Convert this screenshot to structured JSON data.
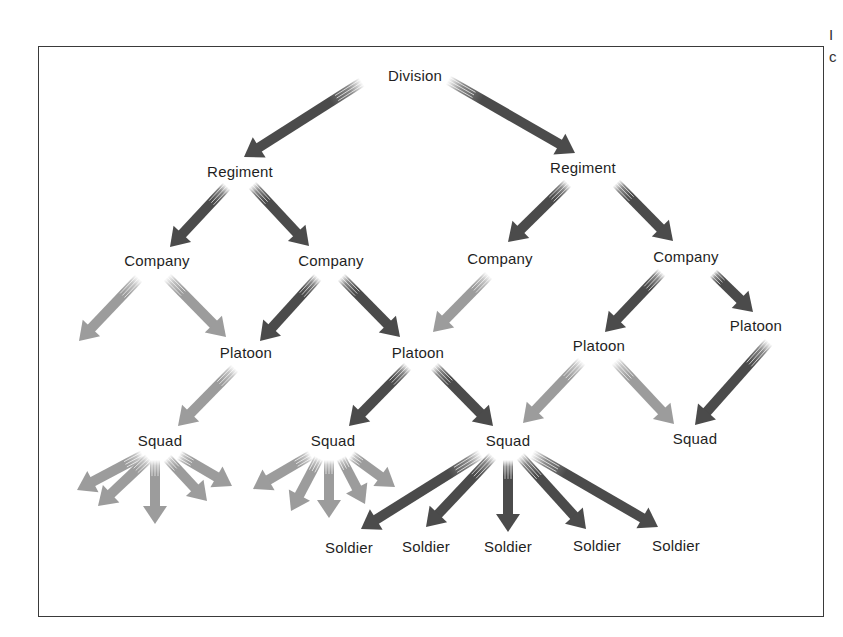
{
  "diagram": {
    "type": "hierarchy",
    "colors": {
      "dark_arrow": "#4b4b4b",
      "light_arrow": "#9c9c9c",
      "text": "#1f1f1f",
      "frame": "#3a3a3a",
      "background": "#ffffff"
    },
    "edge_text_fragments": [
      {
        "text": "I",
        "y": 36
      },
      {
        "text": "c",
        "y": 58
      }
    ],
    "nodes": [
      {
        "id": "division",
        "label": "Division",
        "x": 415,
        "y": 75
      },
      {
        "id": "regiment-1",
        "label": "Regiment",
        "x": 240,
        "y": 171
      },
      {
        "id": "regiment-2",
        "label": "Regiment",
        "x": 583,
        "y": 167
      },
      {
        "id": "company-1",
        "label": "Company",
        "x": 157,
        "y": 260
      },
      {
        "id": "company-2",
        "label": "Company",
        "x": 331,
        "y": 260
      },
      {
        "id": "company-3",
        "label": "Company",
        "x": 500,
        "y": 258
      },
      {
        "id": "company-4",
        "label": "Company",
        "x": 686,
        "y": 256
      },
      {
        "id": "platoon-1",
        "label": "Platoon",
        "x": 246,
        "y": 352
      },
      {
        "id": "platoon-2",
        "label": "Platoon",
        "x": 418,
        "y": 352
      },
      {
        "id": "platoon-3",
        "label": "Platoon",
        "x": 599,
        "y": 345
      },
      {
        "id": "platoon-4",
        "label": "Platoon",
        "x": 756,
        "y": 325
      },
      {
        "id": "squad-1",
        "label": "Squad",
        "x": 160,
        "y": 440
      },
      {
        "id": "squad-2",
        "label": "Squad",
        "x": 333,
        "y": 440
      },
      {
        "id": "squad-3",
        "label": "Squad",
        "x": 508,
        "y": 440
      },
      {
        "id": "squad-4",
        "label": "Squad",
        "x": 695,
        "y": 438
      },
      {
        "id": "soldier-1",
        "label": "Soldier",
        "x": 349,
        "y": 547
      },
      {
        "id": "soldier-2",
        "label": "Soldier",
        "x": 426,
        "y": 546
      },
      {
        "id": "soldier-3",
        "label": "Soldier",
        "x": 508,
        "y": 546
      },
      {
        "id": "soldier-4",
        "label": "Soldier",
        "x": 597,
        "y": 545
      },
      {
        "id": "soldier-5",
        "label": "Soldier",
        "x": 676,
        "y": 545
      }
    ],
    "arrows": [
      {
        "from": "division",
        "to": "regiment-1",
        "tone": "dark",
        "x1": 362,
        "y1": 82,
        "x2": 244,
        "y2": 157
      },
      {
        "from": "division",
        "to": "regiment-2",
        "tone": "dark",
        "x1": 448,
        "y1": 80,
        "x2": 575,
        "y2": 153
      },
      {
        "from": "regiment-1",
        "to": "company-1",
        "tone": "dark",
        "x1": 227,
        "y1": 186,
        "x2": 170,
        "y2": 247
      },
      {
        "from": "regiment-1",
        "to": "company-2",
        "tone": "dark",
        "x1": 252,
        "y1": 185,
        "x2": 309,
        "y2": 246
      },
      {
        "from": "regiment-2",
        "to": "company-3",
        "tone": "dark",
        "x1": 568,
        "y1": 183,
        "x2": 508,
        "y2": 242
      },
      {
        "from": "regiment-2",
        "to": "company-4",
        "tone": "dark",
        "x1": 616,
        "y1": 183,
        "x2": 673,
        "y2": 241
      },
      {
        "from": "company-1",
        "to": "platoon-offframe",
        "tone": "light",
        "x1": 139,
        "y1": 278,
        "x2": 79,
        "y2": 341
      },
      {
        "from": "company-1",
        "to": "platoon-1",
        "tone": "light",
        "x1": 167,
        "y1": 277,
        "x2": 226,
        "y2": 337
      },
      {
        "from": "company-2",
        "to": "platoon-1",
        "tone": "dark",
        "x1": 318,
        "y1": 277,
        "x2": 260,
        "y2": 341
      },
      {
        "from": "company-2",
        "to": "platoon-2",
        "tone": "dark",
        "x1": 341,
        "y1": 277,
        "x2": 400,
        "y2": 337
      },
      {
        "from": "company-3",
        "to": "platoon-2",
        "tone": "light",
        "x1": 489,
        "y1": 275,
        "x2": 433,
        "y2": 332
      },
      {
        "from": "company-4",
        "to": "platoon-3",
        "tone": "dark",
        "x1": 662,
        "y1": 272,
        "x2": 605,
        "y2": 332
      },
      {
        "from": "company-4",
        "to": "platoon-4",
        "tone": "dark",
        "x1": 713,
        "y1": 273,
        "x2": 753,
        "y2": 312
      },
      {
        "from": "platoon-1",
        "to": "squad-1",
        "tone": "light",
        "x1": 235,
        "y1": 368,
        "x2": 178,
        "y2": 426
      },
      {
        "from": "platoon-2",
        "to": "squad-2",
        "tone": "dark",
        "x1": 408,
        "y1": 366,
        "x2": 349,
        "y2": 426
      },
      {
        "from": "platoon-2",
        "to": "squad-3",
        "tone": "dark",
        "x1": 434,
        "y1": 366,
        "x2": 493,
        "y2": 426
      },
      {
        "from": "platoon-3",
        "to": "squad-3",
        "tone": "light",
        "x1": 582,
        "y1": 361,
        "x2": 523,
        "y2": 423
      },
      {
        "from": "platoon-3",
        "to": "squad-4",
        "tone": "light",
        "x1": 615,
        "y1": 361,
        "x2": 674,
        "y2": 424
      },
      {
        "from": "platoon-4",
        "to": "squad-4",
        "tone": "dark",
        "x1": 769,
        "y1": 342,
        "x2": 695,
        "y2": 425
      },
      {
        "from": "squad-1",
        "to": "soldier-offframe",
        "tone": "light",
        "x1": 143,
        "y1": 455,
        "x2": 77,
        "y2": 490
      },
      {
        "from": "squad-1",
        "to": "soldier-offframe",
        "tone": "light",
        "x1": 149,
        "y1": 458,
        "x2": 98,
        "y2": 506
      },
      {
        "from": "squad-1",
        "to": "soldier-offframe",
        "tone": "light",
        "x1": 155,
        "y1": 460,
        "x2": 155,
        "y2": 524
      },
      {
        "from": "squad-1",
        "to": "soldier-offframe",
        "tone": "light",
        "x1": 167,
        "y1": 458,
        "x2": 207,
        "y2": 501
      },
      {
        "from": "squad-1",
        "to": "soldier-offframe",
        "tone": "light",
        "x1": 179,
        "y1": 455,
        "x2": 232,
        "y2": 486
      },
      {
        "from": "squad-2",
        "to": "soldier-offframe",
        "tone": "light",
        "x1": 311,
        "y1": 455,
        "x2": 253,
        "y2": 489
      },
      {
        "from": "squad-2",
        "to": "soldier-offframe",
        "tone": "light",
        "x1": 319,
        "y1": 458,
        "x2": 291,
        "y2": 511
      },
      {
        "from": "squad-2",
        "to": "soldier-offframe",
        "tone": "light",
        "x1": 329,
        "y1": 460,
        "x2": 329,
        "y2": 518
      },
      {
        "from": "squad-2",
        "to": "soldier-offframe",
        "tone": "light",
        "x1": 341,
        "y1": 458,
        "x2": 365,
        "y2": 504
      },
      {
        "from": "squad-2",
        "to": "soldier-offframe",
        "tone": "light",
        "x1": 351,
        "y1": 455,
        "x2": 395,
        "y2": 487
      },
      {
        "from": "squad-3",
        "to": "soldier-1",
        "tone": "dark",
        "x1": 481,
        "y1": 454,
        "x2": 361,
        "y2": 529
      },
      {
        "from": "squad-3",
        "to": "soldier-2",
        "tone": "dark",
        "x1": 493,
        "y1": 456,
        "x2": 426,
        "y2": 527
      },
      {
        "from": "squad-3",
        "to": "soldier-3",
        "tone": "dark",
        "x1": 508,
        "y1": 460,
        "x2": 508,
        "y2": 532
      },
      {
        "from": "squad-3",
        "to": "soldier-4",
        "tone": "dark",
        "x1": 520,
        "y1": 456,
        "x2": 586,
        "y2": 529
      },
      {
        "from": "squad-3",
        "to": "soldier-5",
        "tone": "dark",
        "x1": 532,
        "y1": 454,
        "x2": 658,
        "y2": 527
      }
    ]
  }
}
